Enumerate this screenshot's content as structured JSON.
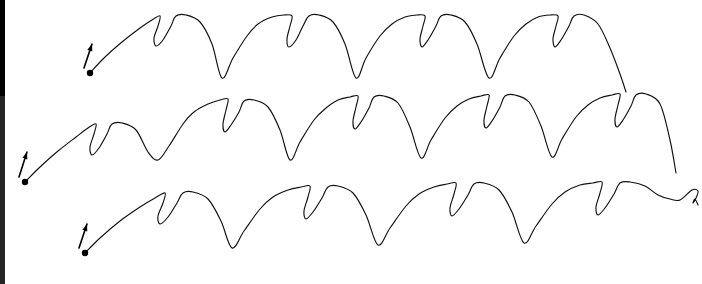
{
  "figure": {
    "width": 702,
    "height": 284,
    "background_color": "#ffffff",
    "stroke_color": "#111111",
    "stroke_width": 1.15,
    "left_edge_strip_color": "#000000",
    "left_edge_strip_width": 5,
    "row_count": 3,
    "motif_description": "rising arc to a peak, a narrow downward fishhook cusp, a second small peak, then a long descending arc into a sharp V valley"
  },
  "chart_data": {
    "type": "line",
    "xlabel": "",
    "ylabel": "",
    "xlim": [
      0,
      702
    ],
    "ylim": [
      284,
      0
    ],
    "grid": false,
    "legend": "none",
    "series": [
      {
        "name": "row-1",
        "start_point": [
          90,
          73
        ],
        "end_point": [
          626,
          92
        ],
        "arch_count": 4,
        "peak_y": 14,
        "valley_y": 78,
        "arch_period": 133,
        "x": [
          90,
          104,
          122,
          140,
          152,
          160,
          158,
          154,
          156,
          163,
          171,
          176,
          186,
          200,
          212,
          222,
          233,
          247,
          258,
          272,
          284,
          292,
          290,
          287,
          289,
          296,
          303,
          309,
          319,
          333,
          345,
          356,
          366,
          380,
          392,
          405,
          417,
          425,
          423,
          420,
          422,
          428,
          436,
          441,
          451,
          465,
          477,
          489,
          500,
          514,
          526,
          538,
          550,
          558,
          556,
          553,
          555,
          561,
          569,
          574,
          584,
          598,
          610,
          620,
          626
        ],
        "y": [
          73,
          58,
          42,
          28,
          20,
          16,
          26,
          38,
          46,
          40,
          26,
          16,
          15,
          22,
          44,
          78,
          58,
          36,
          24,
          17,
          15,
          16,
          26,
          39,
          47,
          40,
          26,
          16,
          15,
          22,
          44,
          78,
          58,
          36,
          24,
          17,
          15,
          16,
          26,
          39,
          47,
          40,
          26,
          16,
          15,
          22,
          44,
          78,
          58,
          36,
          24,
          17,
          15,
          16,
          26,
          39,
          47,
          40,
          26,
          16,
          15,
          24,
          48,
          74,
          92
        ]
      },
      {
        "name": "row-2",
        "start_point": [
          25,
          182
        ],
        "end_point": [
          676,
          173
        ],
        "arch_count": 5,
        "peak_y": 96,
        "valley_y": 160,
        "arch_period": 131,
        "x": [
          25,
          40,
          58,
          76,
          88,
          96,
          94,
          90,
          92,
          99,
          107,
          112,
          122,
          136,
          148,
          158,
          169,
          183,
          194,
          208,
          220,
          228,
          226,
          223,
          225,
          231,
          239,
          244,
          254,
          268,
          280,
          290,
          300,
          314,
          326,
          338,
          350,
          358,
          356,
          353,
          355,
          361,
          369,
          374,
          384,
          398,
          410,
          421,
          431,
          445,
          457,
          469,
          481,
          489,
          487,
          484,
          486,
          492,
          500,
          505,
          515,
          529,
          541,
          552,
          562,
          576,
          588,
          600,
          612,
          620,
          618,
          615,
          617,
          623,
          631,
          636,
          646,
          660,
          670,
          676
        ],
        "y": [
          182,
          167,
          151,
          137,
          128,
          124,
          134,
          147,
          155,
          148,
          134,
          124,
          123,
          130,
          152,
          160,
          146,
          124,
          112,
          104,
          100,
          99,
          110,
          124,
          132,
          125,
          112,
          101,
          100,
          107,
          130,
          160,
          142,
          120,
          108,
          100,
          97,
          96,
          107,
          121,
          129,
          122,
          108,
          97,
          96,
          103,
          127,
          158,
          140,
          118,
          106,
          99,
          96,
          95,
          106,
          120,
          128,
          121,
          107,
          96,
          95,
          102,
          126,
          157,
          139,
          117,
          105,
          98,
          95,
          94,
          105,
          119,
          127,
          120,
          106,
          95,
          94,
          104,
          140,
          173
        ]
      },
      {
        "name": "row-3",
        "start_point": [
          85,
          253
        ],
        "end_point": [
          698,
          205
        ],
        "arch_count": 4,
        "peak_y": 186,
        "valley_y": 248,
        "arch_period": 148,
        "x": [
          85,
          100,
          120,
          140,
          155,
          165,
          163,
          158,
          160,
          168,
          177,
          183,
          193,
          208,
          221,
          232,
          244,
          260,
          273,
          288,
          301,
          310,
          308,
          304,
          306,
          313,
          322,
          328,
          338,
          353,
          366,
          378,
          390,
          406,
          419,
          434,
          447,
          456,
          454,
          450,
          452,
          459,
          468,
          474,
          484,
          499,
          512,
          524,
          536,
          552,
          565,
          580,
          593,
          602,
          600,
          596,
          598,
          605,
          614,
          620,
          630,
          645,
          658,
          670,
          680,
          692,
          698,
          696,
          693,
          695,
          698
        ],
        "y": [
          253,
          238,
          221,
          207,
          198,
          193,
          203,
          216,
          224,
          217,
          203,
          193,
          192,
          199,
          221,
          248,
          231,
          209,
          197,
          190,
          187,
          186,
          197,
          211,
          219,
          212,
          198,
          187,
          186,
          193,
          215,
          245,
          228,
          206,
          194,
          187,
          184,
          183,
          194,
          208,
          216,
          209,
          195,
          184,
          183,
          190,
          212,
          243,
          226,
          204,
          192,
          185,
          183,
          182,
          193,
          207,
          215,
          208,
          194,
          183,
          182,
          186,
          195,
          199,
          200,
          190,
          191,
          198,
          203,
          199,
          205
        ]
      }
    ],
    "start_markers": [
      {
        "name": "row-1-start",
        "dot": [
          90,
          73
        ],
        "arrow_tail": [
          84,
          68
        ],
        "arrow_tip": [
          92,
          44
        ]
      },
      {
        "name": "row-2-start",
        "dot": [
          25,
          182
        ],
        "arrow_tail": [
          19,
          177
        ],
        "arrow_tip": [
          27,
          152
        ]
      },
      {
        "name": "row-3-start",
        "dot": [
          85,
          253
        ],
        "arrow_tail": [
          79,
          248
        ],
        "arrow_tip": [
          87,
          224
        ]
      }
    ]
  },
  "markers": {
    "dot_radius": 3.2,
    "dot_color": "#000000",
    "arrow_color": "#000000",
    "arrow_label": "start direction arrow"
  }
}
